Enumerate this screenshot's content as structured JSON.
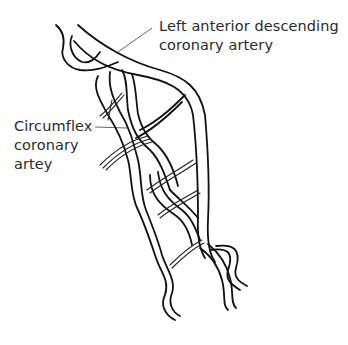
{
  "figure": {
    "background": "#ffffff",
    "line_color": "#111111",
    "text_color": "#2b2b2b"
  },
  "labels": {
    "lad": {
      "line1": "Left anterior descending",
      "line2": "coronary artery"
    },
    "circumflex": {
      "line1": "Circumflex",
      "line2": "coronary",
      "line3": "artey"
    }
  }
}
